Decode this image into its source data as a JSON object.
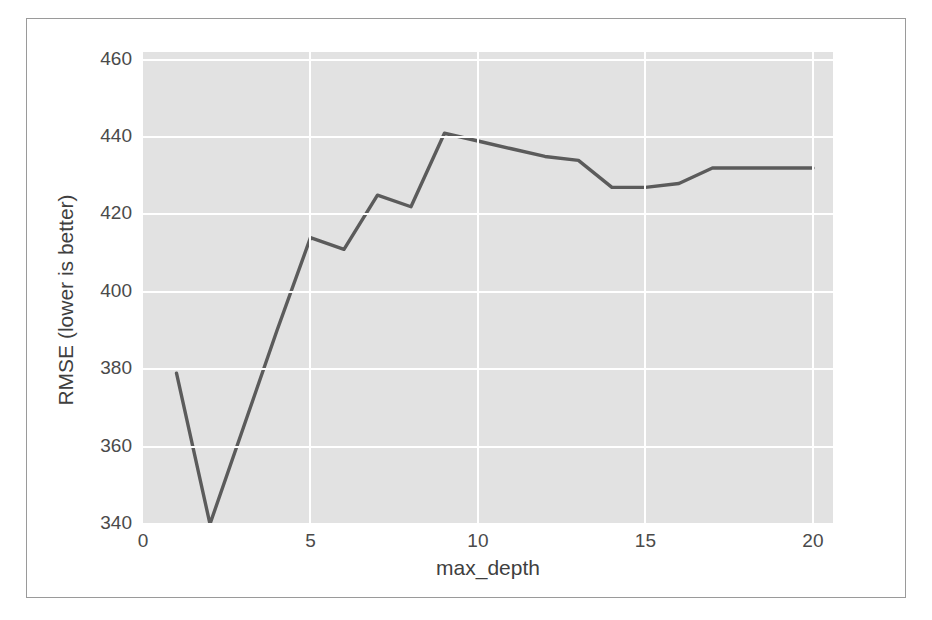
{
  "chart_data": {
    "type": "line",
    "title": "",
    "xlabel": "max_depth",
    "ylabel": "RMSE (lower is better)",
    "xlim": [
      0,
      20.6
    ],
    "ylim": [
      340,
      462
    ],
    "grid": true,
    "legend": null,
    "x": [
      1,
      2,
      3,
      4,
      5,
      6,
      7,
      8,
      9,
      10,
      11,
      12,
      13,
      14,
      15,
      16,
      17,
      18,
      19,
      20
    ],
    "series": [
      {
        "name": "RMSE",
        "color": "#5b5b5b",
        "values": [
          379,
          340,
          365,
          390,
          414,
          411,
          425,
          422,
          441,
          439,
          437,
          435,
          434,
          427,
          427,
          428,
          432,
          432,
          432,
          432
        ]
      }
    ],
    "xticks": [
      0,
      5,
      10,
      15,
      20
    ],
    "xtick_labels": [
      "0",
      "5",
      "10",
      "15",
      "20"
    ],
    "yticks": [
      340,
      360,
      380,
      400,
      420,
      440,
      460
    ],
    "ytick_labels": [
      "340",
      "360",
      "380",
      "400",
      "420",
      "440",
      "460"
    ],
    "style": {
      "plot_background": "#e2e2e2",
      "gridline_color": "#ffffff",
      "figure_background": "#ffffff",
      "frame_border": "#9a9a9a",
      "tick_text": "#4a4a4a"
    }
  }
}
